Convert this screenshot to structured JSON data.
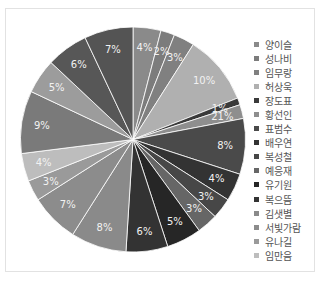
{
  "chart_data": {
    "type": "pie",
    "title": "",
    "legend_position": "right",
    "start_angle_deg": 0,
    "direction": "clockwise",
    "slices": [
      {
        "label": "양이슬",
        "value": 4,
        "color": "#8a8a8a"
      },
      {
        "label": "성나비",
        "value": 2,
        "color": "#7c7c7c"
      },
      {
        "label": "임무랑",
        "value": 3,
        "color": "#808080"
      },
      {
        "label": "허상욱",
        "value": 10,
        "color": "#b0b0b0"
      },
      {
        "label": "장도표",
        "value": 1,
        "color": "#3a3a3a"
      },
      {
        "label": "황선인",
        "value": 2,
        "color": "#8e8e8e"
      },
      {
        "label": "표범수",
        "value": 8,
        "color": "#4a4a4a"
      },
      {
        "label": "배우연",
        "value": 4,
        "color": "#333333"
      },
      {
        "label": "복성철",
        "value": 3,
        "color": "#474747"
      },
      {
        "label": "예응재",
        "value": 3,
        "color": "#666666"
      },
      {
        "label": "유기원",
        "value": 5,
        "color": "#262626"
      },
      {
        "label": "복으뜸",
        "value": 6,
        "color": "#333333"
      },
      {
        "label": "김샛별",
        "value": 8,
        "color": "#8a8a8a"
      },
      {
        "label": "서빛가람",
        "value": 7,
        "color": "#8c8c8c"
      },
      {
        "label": "유나길",
        "value": 3,
        "color": "#9a9a9a"
      },
      {
        "label": "임만음",
        "value": 4,
        "color": "#bdbdbd"
      },
      {
        "label": "",
        "value": 9,
        "color": "#7a7a7a"
      },
      {
        "label": "",
        "value": 5,
        "color": "#9c9c9c"
      },
      {
        "label": "",
        "value": 6,
        "color": "#575757"
      },
      {
        "label": "",
        "value": 7,
        "color": "#545454"
      }
    ],
    "slice_labels": [
      "4%",
      "2%",
      "3%",
      "10%",
      "1%",
      "21%",
      "8%",
      "4%",
      "3%",
      "3%",
      "5%",
      "6%",
      "8%",
      "7%",
      "3%",
      "4%",
      "9%",
      "5%",
      "6%",
      "7%"
    ],
    "legend": [
      "양이슬",
      "성나비",
      "임무랑",
      "허상욱",
      "장도표",
      "황선인",
      "표범수",
      "배우연",
      "복성철",
      "예응재",
      "유기원",
      "복으뜸",
      "김샛별",
      "서빛가람",
      "유나길",
      "임만음"
    ]
  }
}
